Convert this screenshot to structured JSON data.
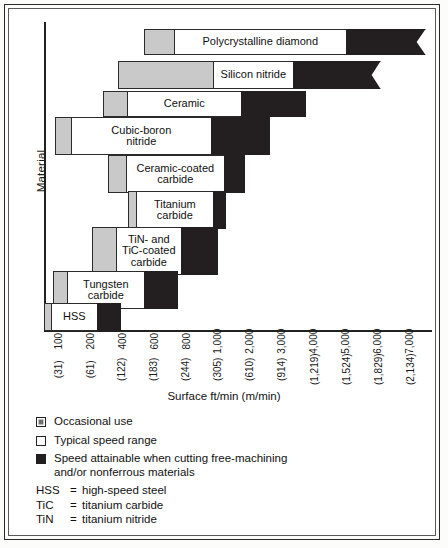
{
  "chart_data": {
    "type": "bar",
    "title": "",
    "xlabel": "Surface ft/min (m/min)",
    "ylabel": "Material",
    "orientation": "horizontal",
    "axis_scale": "piecewise-log",
    "grid": false,
    "xticks": [
      {
        "ft": "100",
        "m": "(31)"
      },
      {
        "ft": "200",
        "m": "(61)"
      },
      {
        "ft": "400",
        "m": "(122)"
      },
      {
        "ft": "600",
        "m": "(183)"
      },
      {
        "ft": "800",
        "m": "(244)"
      },
      {
        "ft": "1,000",
        "m": "(305)"
      },
      {
        "ft": "2,000",
        "m": "(610)"
      },
      {
        "ft": "3,000",
        "m": "(914)"
      },
      {
        "ft": "4,000",
        "m": "(1,219)"
      },
      {
        "ft": "5,000",
        "m": "(1,524)"
      },
      {
        "ft": "6,000",
        "m": "(1,829)"
      },
      {
        "ft": "7,000",
        "m": "(2,134)"
      }
    ],
    "segment_types": [
      "Occasional use",
      "Typical speed range",
      "Speed attainable when cutting free-machining and/or nonferrous materials"
    ],
    "categories": [
      "Polycrystalline diamond",
      "Silicon nitride",
      "Ceramic",
      "Cubic-boron nitride",
      "Ceramic-coated carbide",
      "Titanium carbide",
      "TiN- and TiC-coated carbide",
      "Tungsten carbide",
      "HSS"
    ],
    "bars": [
      {
        "label": "Polycrystalline diamond",
        "label_display": "Polycrystalline diamond",
        "occasional_px": [
          144,
          175
        ],
        "typical_px": [
          175,
          348
        ],
        "attainable_px": [
          348,
          428
        ],
        "continues": true
      },
      {
        "label": "Silicon nitride",
        "label_display": "Silicon nitride",
        "occasional_px": [
          118,
          214
        ],
        "typical_px": [
          214,
          295
        ],
        "attainable_px": [
          295,
          383
        ],
        "continues": true
      },
      {
        "label": "Ceramic",
        "label_display": "Ceramic",
        "occasional_px": [
          103,
          128
        ],
        "typical_px": [
          128,
          243
        ],
        "attainable_px": [
          243,
          308
        ],
        "continues": false
      },
      {
        "label": "Cubic-boron nitride",
        "label_display": "Cubic-boron\nnitride",
        "occasional_px": [
          55,
          72
        ],
        "typical_px": [
          72,
          213
        ],
        "attainable_px": [
          213,
          272
        ],
        "continues": false
      },
      {
        "label": "Ceramic-coated carbide",
        "label_display": "Ceramic-coated\ncarbide",
        "occasional_px": [
          108,
          127
        ],
        "typical_px": [
          127,
          226
        ],
        "attainable_px": [
          226,
          247
        ],
        "continues": false
      },
      {
        "label": "Titanium carbide",
        "label_display": "Titanium\ncarbide",
        "occasional_px": [
          128,
          137
        ],
        "typical_px": [
          137,
          215
        ],
        "attainable_px": [
          215,
          228
        ],
        "continues": false
      },
      {
        "label": "TiN- and TiC-coated carbide",
        "label_display": "TiN- and\nTiC-coated\ncarbide",
        "occasional_px": [
          92,
          117
        ],
        "typical_px": [
          117,
          183
        ],
        "attainable_px": [
          183,
          220
        ],
        "continues": false
      },
      {
        "label": "Tungsten carbide",
        "label_display": "Tungsten\ncarbide",
        "occasional_px": [
          53,
          68
        ],
        "typical_px": [
          68,
          146
        ],
        "attainable_px": [
          146,
          180
        ],
        "continues": false
      },
      {
        "label": "HSS",
        "label_display": "HSS",
        "occasional_px": [
          44,
          52
        ],
        "typical_px": [
          52,
          99
        ],
        "attainable_px": [
          99,
          123
        ],
        "continues": false
      }
    ]
  },
  "legend": {
    "items": [
      {
        "swatch": "occasional",
        "label": "Occasional use"
      },
      {
        "swatch": "typical",
        "label": "Typical speed range"
      },
      {
        "swatch": "attainable",
        "label": "Speed attainable when cutting free-machining\nand/or nonferrous materials"
      }
    ]
  },
  "abbreviations": [
    {
      "key": "HSS",
      "eq": "=",
      "value": "high-speed steel"
    },
    {
      "key": "TiC",
      "eq": "=",
      "value": "titanium carbide"
    },
    {
      "key": "TiN",
      "eq": "=",
      "value": "titanium nitride"
    }
  ],
  "colors": {
    "occasional": "#c9c9c9",
    "typical": "#ffffff",
    "attainable": "#231f20",
    "axis": "#222222",
    "frame": "#2a2a2a"
  }
}
